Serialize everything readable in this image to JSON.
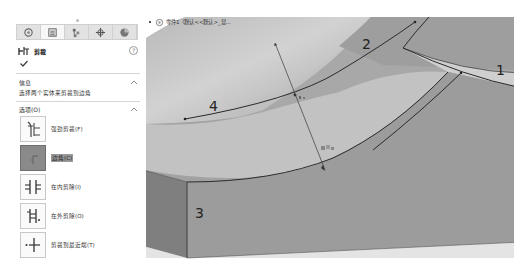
{
  "panel": {
    "tabs": [
      {
        "name": "feature-manager",
        "icon": "feature-tree-icon"
      },
      {
        "name": "property-manager",
        "icon": "property-manager-icon",
        "active": true
      },
      {
        "name": "configuration-manager",
        "icon": "configuration-icon"
      },
      {
        "name": "dimxpert-manager",
        "icon": "dimxpert-icon"
      },
      {
        "name": "display-manager",
        "icon": "appearance-icon"
      }
    ],
    "title": "剪裁",
    "help_label": "?",
    "sections": {
      "message": {
        "header": "信息",
        "text": "选择两个实体来剪裁到边角"
      },
      "options": {
        "header": "选项(O)",
        "items": [
          {
            "label": "强劲剪裁(F)",
            "icon": "power-trim-icon",
            "selected": false
          },
          {
            "label": "边角(C)",
            "icon": "corner-trim-icon",
            "selected": true
          },
          {
            "label": "在内剪除(I)",
            "icon": "trim-away-inside-icon",
            "selected": false
          },
          {
            "label": "在外剪除(O)",
            "icon": "trim-away-outside-icon",
            "selected": false
          },
          {
            "label": "剪裁到最近端(T)",
            "icon": "trim-to-closest-icon",
            "selected": false
          }
        ]
      }
    }
  },
  "breadcrumb": {
    "text": "零件1（默认<<默认>_显..."
  },
  "viewport": {
    "labels": {
      "curve1": "1",
      "curve2": "2",
      "edge3": "3",
      "curve4": "4"
    },
    "colors": {
      "face_light": "#c9c9c9",
      "face_mid": "#a9a9a9",
      "face_dark": "#8f8f8f",
      "side_front": "#9d9d9d",
      "side_left": "#7f7f7f",
      "edge": "#2a2a2a"
    }
  }
}
